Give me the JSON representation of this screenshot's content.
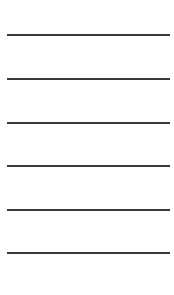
{
  "page": {
    "background": "#ffffff",
    "line_color": "#3a3a3a"
  },
  "lines": [
    {
      "y": 34
    },
    {
      "y": 78
    },
    {
      "y": 122
    },
    {
      "y": 165
    },
    {
      "y": 209
    },
    {
      "y": 252
    }
  ]
}
